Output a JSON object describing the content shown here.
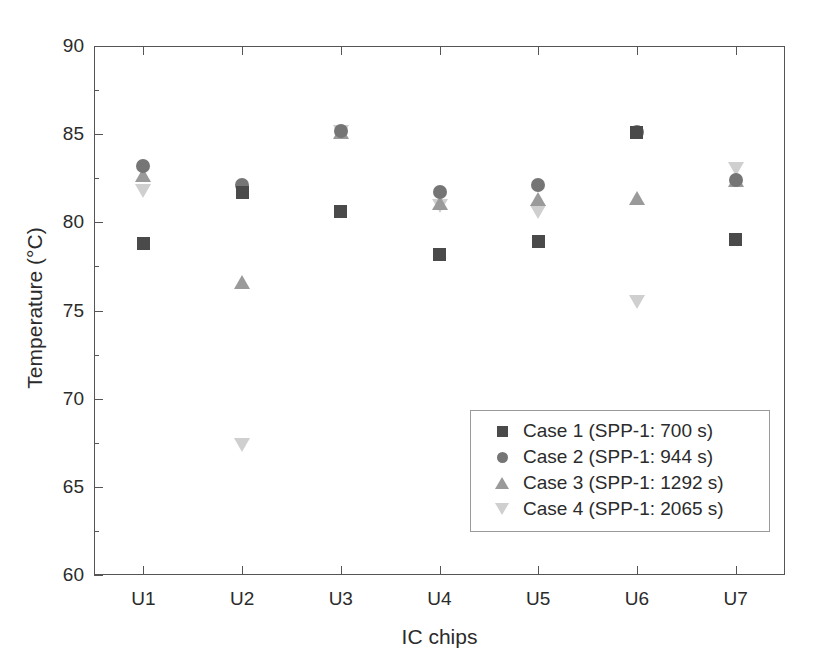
{
  "chart_data": {
    "type": "scatter",
    "title": "",
    "xlabel": "IC chips",
    "ylabel": "Temperature (°C)",
    "categories": [
      "U1",
      "U2",
      "U3",
      "U4",
      "U5",
      "U6",
      "U7"
    ],
    "ylim": [
      60,
      90
    ],
    "yticks": [
      60,
      65,
      70,
      75,
      80,
      85,
      90
    ],
    "ytick_labels": [
      "60",
      "65",
      "70",
      "75",
      "80",
      "85",
      "90"
    ],
    "y_minor_tick_interval": 2.5,
    "grid": false,
    "legend_position": "lower-right-inside",
    "series": [
      {
        "name": "Case 1 (SPP-1: 700 s)",
        "marker": "square",
        "color": "#4a4a4a",
        "values": [
          78.8,
          81.7,
          80.6,
          78.2,
          78.9,
          85.1,
          79.0
        ]
      },
      {
        "name": "Case 2 (SPP-1: 944 s)",
        "marker": "circle",
        "color": "#757575",
        "values": [
          83.2,
          82.1,
          85.2,
          81.7,
          82.1,
          85.1,
          82.4
        ]
      },
      {
        "name": "Case 3 (SPP-1: 1292 s)",
        "marker": "triangle-up",
        "color": "#9a9a9a",
        "values": [
          82.7,
          76.6,
          85.1,
          81.1,
          81.3,
          81.4,
          82.4
        ]
      },
      {
        "name": "Case 4 (SPP-1: 2065 s)",
        "marker": "triangle-down",
        "color": "#cfcfcf",
        "values": [
          81.8,
          67.4,
          85.1,
          80.9,
          80.6,
          75.5,
          83.0
        ]
      }
    ]
  },
  "legend": {
    "entries": [
      {
        "label": "Case 1 (SPP-1: 700 s)",
        "marker": "square"
      },
      {
        "label": "Case 2 (SPP-1: 944 s)",
        "marker": "circle"
      },
      {
        "label": "Case 3 (SPP-1: 1292 s)",
        "marker": "triangle-up"
      },
      {
        "label": "Case 4 (SPP-1: 2065 s)",
        "marker": "triangle-down"
      }
    ]
  }
}
